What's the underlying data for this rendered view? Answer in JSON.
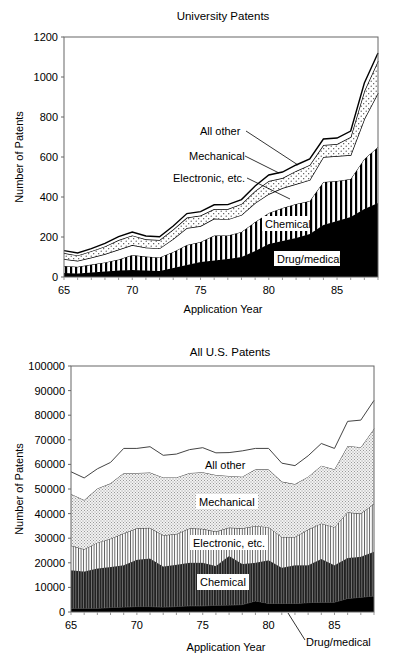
{
  "chart_data": [
    {
      "type": "area",
      "stacked": true,
      "title": "University Patents",
      "xlabel": "Application Year",
      "ylabel": "Number of Patents",
      "xlim": [
        65,
        88
      ],
      "ylim": [
        0,
        1200
      ],
      "xticks": [
        "65",
        "70",
        "75",
        "80",
        "85"
      ],
      "yticks": [
        "0",
        "200",
        "400",
        "600",
        "800",
        "1000",
        "1200"
      ],
      "grid": false,
      "x": [
        65,
        66,
        67,
        68,
        69,
        70,
        71,
        72,
        73,
        74,
        75,
        76,
        77,
        78,
        79,
        80,
        81,
        82,
        83,
        84,
        85,
        86,
        87,
        88
      ],
      "series": [
        {
          "name": "Drug/medical",
          "pattern": "solid-black",
          "values": [
            20,
            18,
            22,
            28,
            32,
            35,
            32,
            30,
            45,
            60,
            75,
            82,
            90,
            100,
            130,
            165,
            180,
            195,
            215,
            260,
            280,
            300,
            340,
            370
          ]
        },
        {
          "name": "Chemical",
          "pattern": "vertical-stripes",
          "values": [
            35,
            33,
            40,
            45,
            55,
            75,
            70,
            68,
            80,
            100,
            100,
            125,
            118,
            125,
            145,
            155,
            165,
            170,
            165,
            215,
            200,
            190,
            250,
            280
          ]
        },
        {
          "name": "Electronic, etc.",
          "pattern": "white",
          "values": [
            35,
            30,
            35,
            42,
            50,
            50,
            45,
            45,
            65,
            85,
            80,
            85,
            80,
            85,
            95,
            95,
            100,
            100,
            105,
            125,
            125,
            120,
            200,
            270
          ]
        },
        {
          "name": "Mechanical",
          "pattern": "dots",
          "values": [
            30,
            27,
            32,
            38,
            48,
            48,
            42,
            42,
            48,
            52,
            52,
            48,
            52,
            55,
            60,
            65,
            50,
            65,
            75,
            60,
            60,
            90,
            140,
            160
          ]
        },
        {
          "name": "All other",
          "pattern": "white-outlined",
          "values": [
            12,
            12,
            13,
            15,
            17,
            17,
            16,
            16,
            17,
            20,
            20,
            21,
            22,
            22,
            25,
            30,
            30,
            30,
            30,
            30,
            30,
            30,
            40,
            40
          ]
        }
      ],
      "annotations": [
        {
          "text": "All other",
          "type": "leader-line"
        },
        {
          "text": "Mechanical",
          "type": "leader-line"
        },
        {
          "text": "Electronic, etc.",
          "type": "leader-line"
        },
        {
          "text": "Chemical",
          "type": "inline-box"
        },
        {
          "text": "Drug/medical",
          "type": "inline-box"
        }
      ]
    },
    {
      "type": "area",
      "stacked": true,
      "title": "All U.S. Patents",
      "xlabel": "Application Year",
      "ylabel": "Number of Patents",
      "xlim": [
        65,
        88
      ],
      "ylim": [
        0,
        100000
      ],
      "xticks": [
        "65",
        "70",
        "75",
        "80",
        "85"
      ],
      "yticks": [
        "0",
        "10000",
        "20000",
        "30000",
        "40000",
        "50000",
        "60000",
        "70000",
        "80000",
        "90000",
        "100000"
      ],
      "grid": false,
      "x": [
        65,
        66,
        67,
        68,
        69,
        70,
        71,
        72,
        73,
        74,
        75,
        76,
        77,
        78,
        79,
        80,
        81,
        82,
        83,
        84,
        85,
        86,
        87,
        88
      ],
      "series": [
        {
          "name": "Drug/medical",
          "pattern": "solid-black",
          "values": [
            1500,
            1500,
            1500,
            1800,
            2000,
            2200,
            2200,
            2000,
            2200,
            2500,
            2500,
            2700,
            2800,
            3000,
            4500,
            3500,
            3500,
            3500,
            3800,
            4000,
            4000,
            5500,
            6000,
            6500
          ]
        },
        {
          "name": "Chemical",
          "pattern": "dense-vertical-stripes-dark",
          "values": [
            15500,
            15000,
            16200,
            16500,
            17000,
            19000,
            19500,
            16500,
            17000,
            17500,
            17500,
            16000,
            20000,
            16500,
            15500,
            17500,
            14500,
            15500,
            15200,
            17500,
            15000,
            16500,
            16500,
            18000
          ]
        },
        {
          "name": "Electronic, etc.",
          "pattern": "vertical-stripes-light",
          "values": [
            10000,
            9000,
            10500,
            11500,
            13000,
            12800,
            12500,
            12700,
            12500,
            14000,
            13800,
            14000,
            11500,
            14500,
            15000,
            13500,
            12500,
            11500,
            14500,
            14500,
            15500,
            18500,
            17500,
            19500
          ]
        },
        {
          "name": "Mechanical",
          "pattern": "fine-dots",
          "values": [
            21000,
            20000,
            22000,
            22500,
            24500,
            22500,
            22500,
            23500,
            23000,
            22500,
            23000,
            23000,
            21000,
            21000,
            23000,
            23500,
            22500,
            21500,
            21500,
            23500,
            23500,
            27000,
            27000,
            30500
          ]
        },
        {
          "name": "All other",
          "pattern": "white",
          "values": [
            9000,
            9000,
            8000,
            8500,
            10000,
            10000,
            10500,
            9000,
            9500,
            9500,
            10000,
            9000,
            9500,
            10500,
            8500,
            8500,
            7500,
            7500,
            8500,
            9000,
            8500,
            10000,
            11000,
            11500
          ]
        }
      ],
      "annotations": [
        {
          "text": "All other",
          "type": "inline"
        },
        {
          "text": "Mechanical",
          "type": "inline-box"
        },
        {
          "text": "Electronic, etc.",
          "type": "inline-box"
        },
        {
          "text": "Chemical",
          "type": "inline-box"
        },
        {
          "text": "Drug/medical",
          "type": "leader-line"
        }
      ]
    }
  ]
}
